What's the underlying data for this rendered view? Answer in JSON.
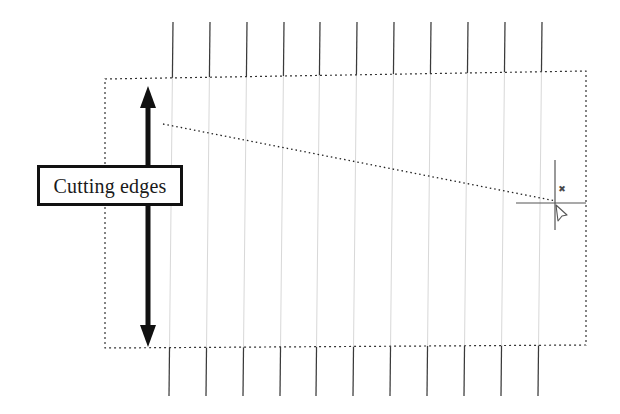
{
  "figure": {
    "background_color": "#ffffff",
    "width": 620,
    "height": 414
  },
  "callout": {
    "label": "Cutting edges",
    "box": {
      "x": 37,
      "y": 165,
      "width": 146,
      "height": 41
    },
    "border_color": "#111111",
    "fill_color": "#ffffff",
    "text_color": "#1a1a1a"
  },
  "double_arrow": {
    "name": "vertical-double-arrow",
    "x": 148,
    "y_top": 86,
    "y_bottom": 347,
    "color": "#111111",
    "shaft_width": 5,
    "head_width": 16,
    "head_length": 22
  },
  "workpiece_outline": {
    "name": "dashed-rectangle",
    "corners": {
      "top_left": {
        "x": 105,
        "y": 79
      },
      "top_right": {
        "x": 586,
        "y": 71
      },
      "bottom_right": {
        "x": 586,
        "y": 345
      },
      "bottom_left": {
        "x": 105,
        "y": 348
      }
    },
    "stroke_color": "#333333",
    "dash_pattern": "2 3"
  },
  "leader_line": {
    "name": "dotted-leader-line",
    "from": {
      "x": 163,
      "y": 124
    },
    "to": {
      "x": 556,
      "y": 201
    },
    "stroke_color": "#222222",
    "dash_pattern": "1.5 3"
  },
  "crosshair_marker": {
    "name": "crosshair-target",
    "center": {
      "x": 555,
      "y": 203
    },
    "vertical": {
      "y_top": 160,
      "y_bottom": 230
    },
    "horizontal": {
      "x_left": 516,
      "x_right": 586
    },
    "stroke_color": "#555555",
    "x_glyph": {
      "x": 562,
      "y": 192,
      "symbol": "✖"
    },
    "cursor_glyph": {
      "x": 556,
      "y": 205
    }
  },
  "tool_lines": {
    "name": "vertical-tool-lines",
    "count": 11,
    "top_y": 22,
    "bottom_y": 396,
    "dark_color": "#3a3a3a",
    "inside_color": "#d8d8d8",
    "x_positions_top": [
      173,
      210,
      247,
      284,
      320,
      357,
      394,
      431,
      468,
      505,
      542
    ],
    "slant_dx": -4
  }
}
